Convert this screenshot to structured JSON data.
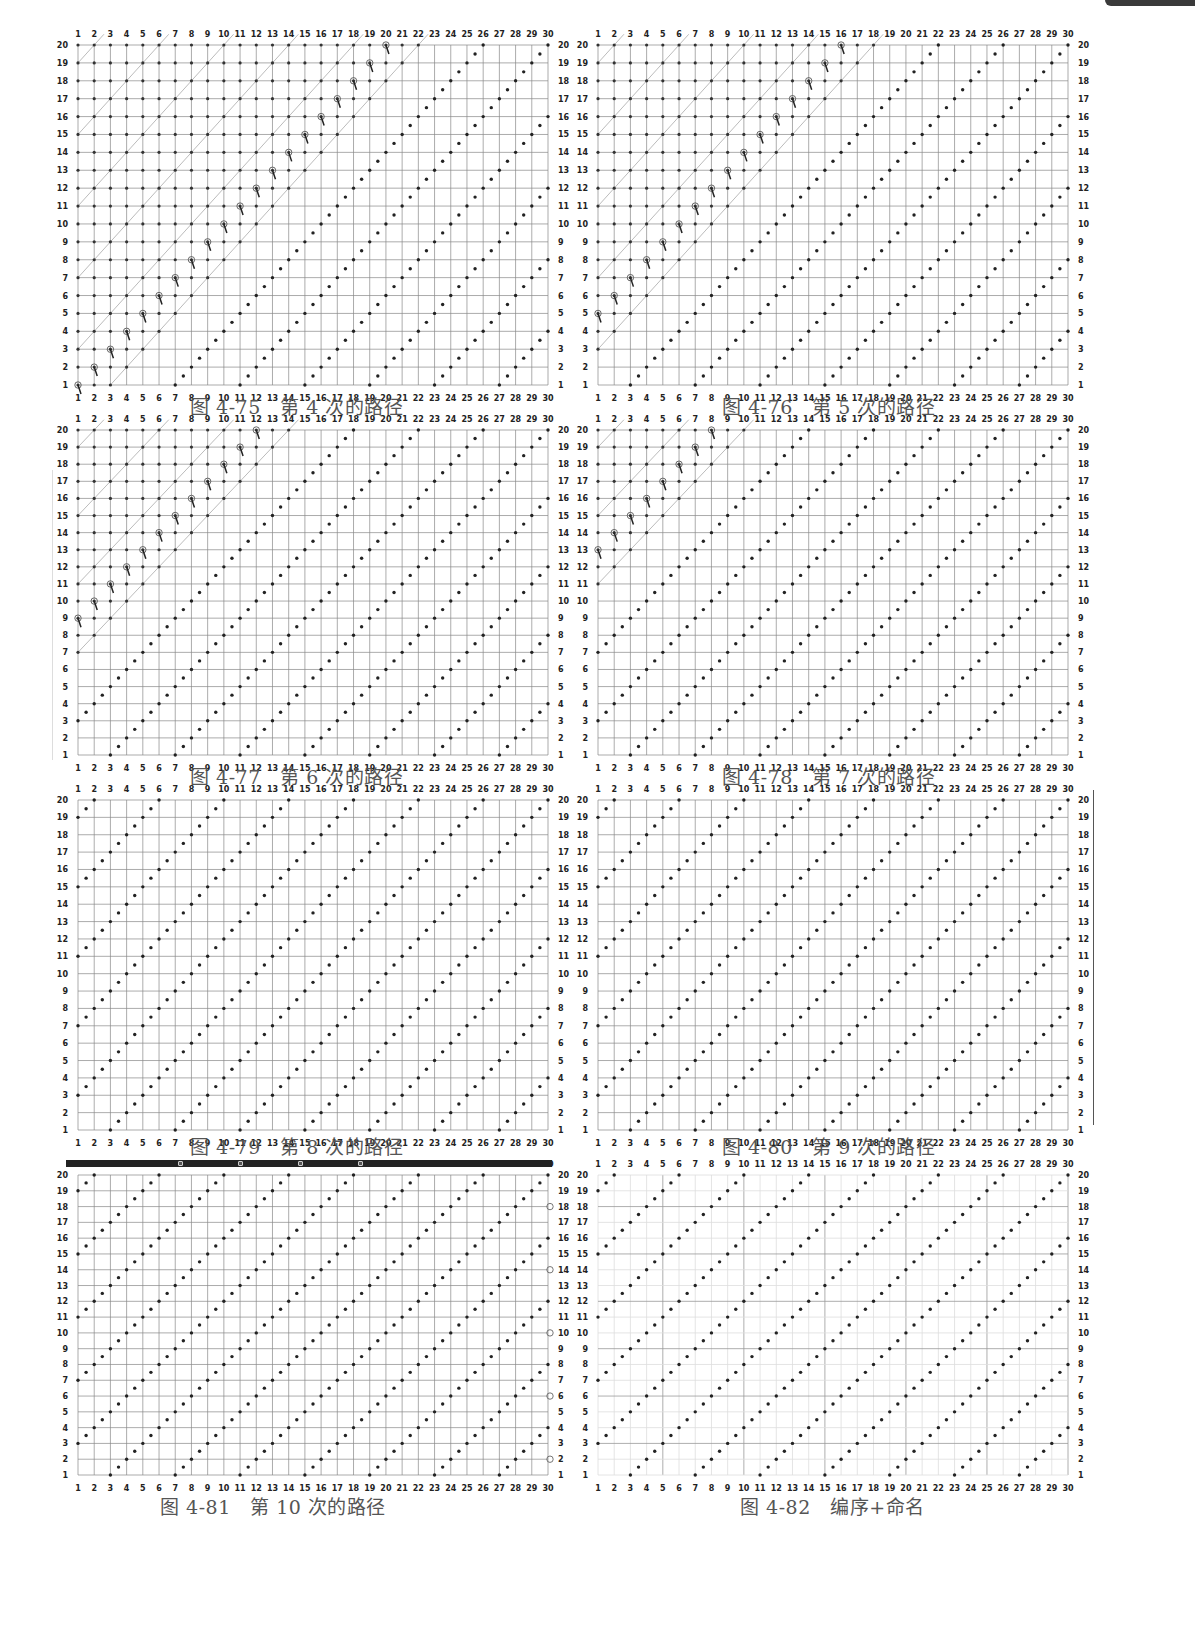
{
  "page": {
    "top_tab_color": "#3a3a3a"
  },
  "grid": {
    "cols": 30,
    "rows": 20,
    "x_labels": [
      "1",
      "2",
      "3",
      "4",
      "5",
      "6",
      "7",
      "8",
      "9",
      "10",
      "11",
      "12",
      "13",
      "14",
      "15",
      "16",
      "17",
      "18",
      "19",
      "20",
      "21",
      "22",
      "23",
      "24",
      "25",
      "26",
      "27",
      "28",
      "29",
      "30"
    ],
    "y_labels": [
      "1",
      "2",
      "3",
      "4",
      "5",
      "6",
      "7",
      "8",
      "9",
      "10",
      "11",
      "12",
      "13",
      "14",
      "15",
      "16",
      "17",
      "18",
      "19",
      "20"
    ]
  },
  "figures": [
    {
      "id": "4-75",
      "caption": "图 4-75　第 4 次的路径",
      "pass": 4,
      "box": [
        78,
        45,
        470,
        340
      ],
      "marker_style": "loop",
      "completed_from_col": 5
    },
    {
      "id": "4-76",
      "caption": "图 4-76　第 5 次的路径",
      "pass": 5,
      "box": [
        598,
        45,
        470,
        340
      ],
      "marker_style": "loop",
      "completed_from_col": 5
    },
    {
      "id": "4-77",
      "caption": "图 4-77　第 6 次的路径",
      "pass": 6,
      "box": [
        78,
        430,
        470,
        325
      ],
      "marker_style": "loop",
      "completed_from_col": 4
    },
    {
      "id": "4-78",
      "caption": "图 4-78　第 7 次的路径",
      "pass": 7,
      "box": [
        598,
        430,
        470,
        325
      ],
      "marker_style": "loop-left",
      "completed_from_col": 1
    },
    {
      "id": "4-79",
      "caption": "图 4-79　第 8 次的路径",
      "pass": 8,
      "box": [
        78,
        800,
        470,
        330
      ],
      "marker_style": "arrow",
      "completed_from_col": 1
    },
    {
      "id": "4-80",
      "caption": "图 4-80　第 9 次的路径",
      "pass": 9,
      "box": [
        598,
        800,
        470,
        330
      ],
      "marker_style": "arrow-up",
      "completed_from_col": 1
    },
    {
      "id": "4-81",
      "caption": "图 4-81　第 10 次的路径",
      "pass": 10,
      "box": [
        78,
        1175,
        470,
        300
      ],
      "marker_style": "edge",
      "completed_from_col": 1
    },
    {
      "id": "4-82",
      "caption": "图 4-82　编序+命名",
      "pass": 0,
      "box": [
        598,
        1175,
        470,
        300
      ],
      "marker_style": "final",
      "completed_from_col": 1
    }
  ],
  "captions_pos": [
    [
      190,
      392
    ],
    [
      722,
      392
    ],
    [
      190,
      762
    ],
    [
      722,
      762
    ],
    [
      190,
      1132
    ],
    [
      722,
      1132
    ],
    [
      160,
      1492
    ],
    [
      740,
      1492
    ]
  ]
}
